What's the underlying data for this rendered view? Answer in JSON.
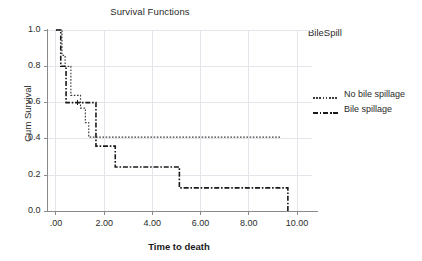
{
  "chart_data": {
    "type": "line",
    "title": "Survival Functions",
    "xlabel": "Time to death",
    "ylabel": "Cum Survival",
    "xlim": [
      -0.35,
      10.6
    ],
    "ylim": [
      0.0,
      1.0
    ],
    "grid": true,
    "legend_title": "BileSpill",
    "legend_position": "right",
    "xticks": [
      0,
      2,
      4,
      6,
      8,
      10
    ],
    "xtick_labels": [
      ".00",
      "2.00",
      "4.00",
      "6.00",
      "8.00",
      "10.00"
    ],
    "yticks": [
      0.0,
      0.2,
      0.4,
      0.6,
      0.8,
      1.0
    ],
    "ytick_labels": [
      "0.0",
      "0.2",
      "0.4",
      "0.6",
      "0.8",
      "1.0"
    ],
    "series": [
      {
        "name": "No bile spillage",
        "style": "dotted",
        "color": "#3a3a3a",
        "points": [
          [
            0.0,
            1.0
          ],
          [
            0.25,
            1.0
          ],
          [
            0.25,
            0.86
          ],
          [
            0.38,
            0.86
          ],
          [
            0.38,
            0.8
          ],
          [
            0.62,
            0.8
          ],
          [
            0.62,
            0.64
          ],
          [
            1.02,
            0.64
          ],
          [
            1.02,
            0.57
          ],
          [
            1.22,
            0.57
          ],
          [
            1.22,
            0.49
          ],
          [
            1.36,
            0.49
          ],
          [
            1.36,
            0.41
          ],
          [
            9.32,
            0.41
          ]
        ]
      },
      {
        "name": "Bile spillage",
        "style": "dashdot",
        "color": "#1a1a1a",
        "points": [
          [
            0.0,
            1.0
          ],
          [
            0.2,
            1.0
          ],
          [
            0.2,
            0.8
          ],
          [
            0.42,
            0.8
          ],
          [
            0.42,
            0.6
          ],
          [
            1.66,
            0.6
          ],
          [
            1.66,
            0.36
          ],
          [
            2.46,
            0.36
          ],
          [
            2.46,
            0.245
          ],
          [
            5.12,
            0.245
          ],
          [
            5.12,
            0.13
          ],
          [
            9.62,
            0.13
          ],
          [
            9.62,
            0.0
          ]
        ]
      }
    ]
  },
  "colors": {
    "axis": "#8a8a8a",
    "grid": "#e2e6ea",
    "text": "#2b2b2b",
    "background": "#ffffff"
  }
}
